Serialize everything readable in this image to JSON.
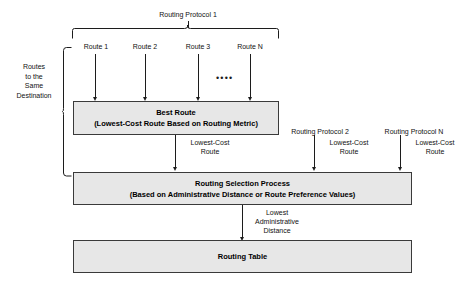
{
  "diagram": {
    "colors": {
      "box_fill": "#e7e7e7",
      "box_border": "#3a3a3a",
      "line": "#1c1c1c",
      "text": "#000000",
      "background": "#ffffff"
    }
  },
  "labels": {
    "routing_protocol_1": "Routing Protocol 1",
    "routing_protocol_2": "Routing Protocol 2",
    "routing_protocol_n": "Routing Protocol N",
    "routes_same_destination": "Routes\nto the\nSame\nDestination",
    "route_1": "Route 1",
    "route_2": "Route 2",
    "route_3": "Route 3",
    "route_n": "Route N",
    "ellipsis_dots": "••••",
    "lowest_cost_route_1": "Lowest-Cost\nRoute",
    "lowest_cost_route_2": "Lowest-Cost\nRoute",
    "lowest_cost_route_n": "Lowest-Cost\nRoute",
    "lowest_administrative_distance": "Lowest\nAdministrative\nDistance"
  },
  "boxes": {
    "best_route": {
      "line1": "Best Route",
      "line2": "(Lowest-Cost Route Based on Routing Metric)"
    },
    "routing_selection_process": {
      "line1": "Routing Selection Process",
      "line2": "(Based on Administrative Distance or Route Preference Values)"
    },
    "routing_table": {
      "line1": "Routing Table"
    }
  }
}
